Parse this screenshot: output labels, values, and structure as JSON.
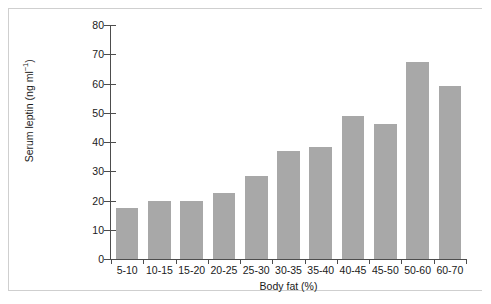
{
  "chart_data": {
    "type": "bar",
    "title": "",
    "subtitle": "",
    "xlabel": "Body fat (%)",
    "ylabel": "Serum leptin (ng ml−1)",
    "ylabel_base": "Serum leptin (ng ml",
    "ylabel_sup": "−1",
    "ylabel_tail": ")",
    "categories": [
      "5-10",
      "10-15",
      "15-20",
      "20-25",
      "25-30",
      "30-35",
      "35-40",
      "40-45",
      "45-50",
      "50-60",
      "60-70"
    ],
    "values": [
      17.5,
      20.0,
      19.7,
      22.6,
      28.4,
      37.0,
      38.3,
      49.0,
      46.0,
      67.5,
      59.0
    ],
    "ylim": [
      0,
      80
    ],
    "yticks": [
      0,
      10,
      20,
      30,
      40,
      50,
      60,
      70,
      80
    ],
    "ytick_labels": [
      "0",
      "10",
      "20",
      "30",
      "40",
      "50",
      "60",
      "70",
      "80"
    ],
    "grid": false,
    "legend": null,
    "bar_color": "#a8a8a8",
    "axis_color": "#4d4d4d",
    "frame_color": "#cfcfcf",
    "background": "#ffffff"
  }
}
